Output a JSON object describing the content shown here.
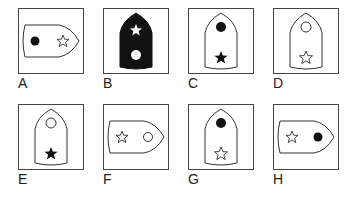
{
  "figure": {
    "type": "visual-reasoning-options",
    "colors": {
      "stroke": "#333333",
      "fill_dark": "#111111",
      "background": "#ffffff"
    },
    "options": [
      {
        "label": "A",
        "orientation": "right",
        "shield_fill": "white",
        "circle": "filled",
        "star": "outline",
        "circle_position": "base",
        "star_position": "tip"
      },
      {
        "label": "B",
        "orientation": "up",
        "shield_fill": "black",
        "circle": "white",
        "star": "white",
        "circle_position": "base",
        "star_position": "tip"
      },
      {
        "label": "C",
        "orientation": "up",
        "shield_fill": "white",
        "circle": "filled",
        "star": "filled",
        "circle_position": "tip",
        "star_position": "base"
      },
      {
        "label": "D",
        "orientation": "up",
        "shield_fill": "white",
        "circle": "outline",
        "star": "outline",
        "circle_position": "tip",
        "star_position": "base"
      },
      {
        "label": "E",
        "orientation": "up",
        "shield_fill": "white",
        "circle": "outline",
        "star": "filled",
        "circle_position": "tip",
        "star_position": "base"
      },
      {
        "label": "F",
        "orientation": "right",
        "shield_fill": "white",
        "circle": "outline",
        "star": "outline",
        "circle_position": "tip",
        "star_position": "base"
      },
      {
        "label": "G",
        "orientation": "up",
        "shield_fill": "white",
        "circle": "filled",
        "star": "outline",
        "circle_position": "tip",
        "star_position": "base"
      },
      {
        "label": "H",
        "orientation": "right",
        "shield_fill": "white",
        "circle": "filled",
        "star": "outline",
        "circle_position": "tip",
        "star_position": "base"
      }
    ]
  }
}
